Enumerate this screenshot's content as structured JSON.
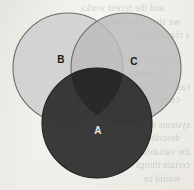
{
  "figure": {
    "kind": "venn-diagram",
    "medium": "scanned-book-page",
    "background_color": "#eeece6"
  },
  "chart_data": {
    "type": "venn",
    "title": "",
    "sets": [
      {
        "id": "B",
        "label": "B",
        "position": "top-left",
        "center": [
          68,
          68
        ],
        "radius": 55,
        "fill": "#d2d2d2",
        "stroke": "#6b6b6b",
        "label_color": "#1a1a1a",
        "label_pos": [
          61,
          60
        ],
        "z": 1
      },
      {
        "id": "C",
        "label": "C",
        "position": "top-right",
        "center": [
          126,
          68
        ],
        "radius": 55,
        "fill": "#bcbcbc",
        "stroke": "#6b6b6b",
        "label_color": "#1a1a1a",
        "label_pos": [
          134,
          62
        ],
        "z": 2
      },
      {
        "id": "A",
        "label": "A",
        "position": "bottom-center",
        "center": [
          97,
          123
        ],
        "radius": 55,
        "fill": "#343434",
        "stroke": "#1f1f1f",
        "label_color": "#e8e8e8",
        "label_pos": [
          98,
          131
        ],
        "z": 3
      }
    ],
    "overlaps": [
      {
        "sets": [
          "B",
          "C"
        ],
        "shade": "#c5c5c5"
      },
      {
        "sets": [
          "A",
          "B"
        ],
        "shade": "#343434"
      },
      {
        "sets": [
          "A",
          "C"
        ],
        "shade": "#343434"
      },
      {
        "sets": [
          "A",
          "B",
          "C"
        ],
        "shade": "#262626"
      }
    ],
    "legend": null
  },
  "labels": {
    "b": "B",
    "c": "C",
    "a": "A"
  },
  "ghost_text": {
    "lines": [
      "and the recent works",
      "we shall consider in",
      "a classification",
      "",
      "sense, so that",
      "an essentially",
      "cases in which",
      "concerning the",
      "",
      "systems of the",
      "described in",
      "the variable",
      "certain things",
      "would be"
    ]
  }
}
